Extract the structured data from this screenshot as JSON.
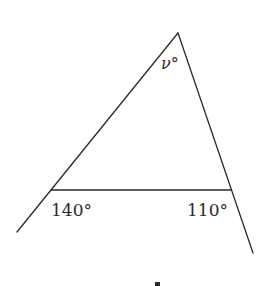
{
  "diagram": {
    "type": "triangle-exterior-angles",
    "vertices": {
      "apex": {
        "x": 178,
        "y": 33
      },
      "left": {
        "x": 51,
        "y": 190
      },
      "right": {
        "x": 231,
        "y": 190
      }
    },
    "extensions": {
      "left_line_end": {
        "x": 17,
        "y": 232
      },
      "right_line_end": {
        "x": 253,
        "y": 253
      }
    },
    "labels": {
      "apex_angle": "ν°",
      "left_exterior_angle": "140°",
      "right_exterior_angle": "110°"
    },
    "colors": {
      "stroke": "#2a2a2a",
      "background": "#ffffff"
    }
  }
}
